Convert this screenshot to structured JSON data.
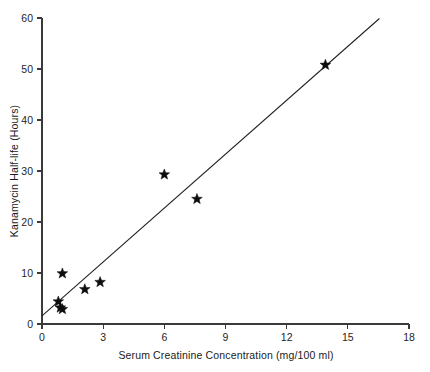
{
  "chart_data": {
    "type": "scatter",
    "title": "",
    "xlabel": "Serum Creatinine Concentration (mg/100 ml)",
    "ylabel": "Kanamycin Half-life (Hours)",
    "xlim": [
      0,
      18
    ],
    "ylim": [
      0,
      60
    ],
    "xticks": [
      0,
      3,
      6,
      9,
      12,
      15,
      18
    ],
    "yticks": [
      0,
      10,
      20,
      30,
      40,
      50,
      60
    ],
    "xtick_labels": [
      "0",
      "3",
      "6",
      "9",
      "12",
      "15",
      "18"
    ],
    "ytick_labels": [
      "0",
      "10",
      "20",
      "30",
      "40",
      "50",
      "60"
    ],
    "grid": false,
    "legend": false,
    "marker": "star",
    "marker_color": "#0d0d0d",
    "line_color": "#1f1f1f",
    "axis_color": "#3a3a3a",
    "background": "#ffffff",
    "points": [
      {
        "x": 0.8,
        "y": 4.4
      },
      {
        "x": 0.9,
        "y": 3.2
      },
      {
        "x": 1.0,
        "y": 2.9
      },
      {
        "x": 1.0,
        "y": 9.9
      },
      {
        "x": 2.1,
        "y": 6.8
      },
      {
        "x": 2.85,
        "y": 8.2
      },
      {
        "x": 6.0,
        "y": 29.3
      },
      {
        "x": 7.6,
        "y": 24.5
      },
      {
        "x": 13.9,
        "y": 50.8
      }
    ],
    "fit_line": {
      "label": "regression line",
      "x_start": 0.0,
      "y_start": 1.6,
      "x_end": 16.55,
      "y_end": 59.9
    }
  }
}
